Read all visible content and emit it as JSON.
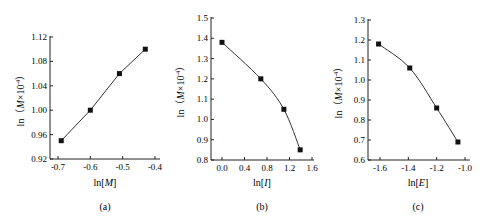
{
  "chart_data": [
    {
      "type": "line",
      "panel": "(a)",
      "xlabel": "ln[M]",
      "ylabel": "ln（M×10⁻⁴）",
      "xlim": [
        -0.72,
        -0.39
      ],
      "ylim": [
        0.92,
        1.12
      ],
      "xticks": [
        -0.7,
        -0.6,
        -0.5,
        -0.4
      ],
      "xtick_labels": [
        "-0.7",
        "-0.6",
        "-0.5",
        "-0.4"
      ],
      "yticks": [
        0.92,
        0.96,
        1.0,
        1.04,
        1.08,
        1.12
      ],
      "ytick_labels": [
        "0.92",
        "0.96",
        "1.00",
        "1.04",
        "1.08",
        "1.12"
      ],
      "grid": false,
      "series": [
        {
          "name": "data",
          "marker": "square",
          "x": [
            -0.69,
            -0.6,
            -0.51,
            -0.43
          ],
          "y": [
            0.95,
            1.0,
            1.06,
            1.1
          ]
        }
      ],
      "fit": "linear"
    },
    {
      "type": "line",
      "panel": "(b)",
      "xlabel": "ln[I]",
      "ylabel": "ln（M×10⁻⁴）",
      "xlim": [
        -0.2,
        1.65
      ],
      "ylim": [
        0.8,
        1.5
      ],
      "xticks": [
        0.0,
        0.4,
        0.8,
        1.2,
        1.6
      ],
      "xtick_labels": [
        "0.0",
        "0.4",
        "0.8",
        "1.2",
        "1.6"
      ],
      "yticks": [
        0.8,
        0.9,
        1.0,
        1.1,
        1.2,
        1.3,
        1.4,
        1.5
      ],
      "ytick_labels": [
        "0.8",
        "0.9",
        "1.0",
        "1.1",
        "1.2",
        "1.3",
        "1.4",
        "1.5"
      ],
      "grid": false,
      "series": [
        {
          "name": "data",
          "marker": "square",
          "x": [
            0.0,
            0.69,
            1.1,
            1.39
          ],
          "y": [
            1.38,
            1.2,
            1.05,
            0.85
          ]
        }
      ],
      "fit": "curve"
    },
    {
      "type": "line",
      "panel": "(c)",
      "xlabel": "ln[E]",
      "ylabel": "ln（M×10⁻⁴）",
      "xlim": [
        -1.69,
        -0.98
      ],
      "ylim": [
        0.6,
        1.3
      ],
      "xticks": [
        -1.6,
        -1.4,
        -1.2,
        -1.0
      ],
      "xtick_labels": [
        "-1.6",
        "-1.4",
        "-1.2",
        "-1.0"
      ],
      "yticks": [
        0.6,
        0.7,
        0.8,
        0.9,
        1.0,
        1.1,
        1.2,
        1.3
      ],
      "ytick_labels": [
        "0.6",
        "0.7",
        "0.8",
        "0.9",
        "1.0",
        "1.1",
        "1.2",
        "1.3"
      ],
      "grid": false,
      "series": [
        {
          "name": "data",
          "marker": "square",
          "x": [
            -1.61,
            -1.39,
            -1.2,
            -1.05
          ],
          "y": [
            1.18,
            1.06,
            0.86,
            0.69
          ]
        }
      ],
      "fit": "curve"
    }
  ],
  "panels": {
    "a": {
      "label": "(a)",
      "xlabel_main": "ln[",
      "xlabel_var": "M",
      "xlabel_end": "]"
    },
    "b": {
      "label": "(b)",
      "xlabel_main": "ln[",
      "xlabel_var": "I",
      "xlabel_end": "]"
    },
    "c": {
      "label": "(c)",
      "xlabel_main": "ln[",
      "xlabel_var": "E",
      "xlabel_end": "]"
    }
  },
  "ylabel": {
    "prefix": "ln（",
    "var": "M",
    "mid": "×10",
    "exp": "-4",
    "suffix": "）"
  },
  "colors": {
    "axis": "#222222",
    "line": "#333333",
    "marker": "#111111"
  }
}
